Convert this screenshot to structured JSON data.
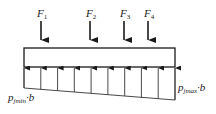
{
  "diagram": {
    "type": "beam-on-elastic-foundation",
    "forces": [
      {
        "label": "F",
        "sub": "1"
      },
      {
        "label": "F",
        "sub": "2"
      },
      {
        "label": "F",
        "sub": "3"
      },
      {
        "label": "F",
        "sub": "4"
      }
    ],
    "reaction_left": {
      "p": "p",
      "sub": "jmin",
      "suffix": "·b"
    },
    "reaction_right": {
      "p": "p",
      "sub": "jmax",
      "suffix": "·b"
    },
    "reaction_arrow_count": 10
  }
}
